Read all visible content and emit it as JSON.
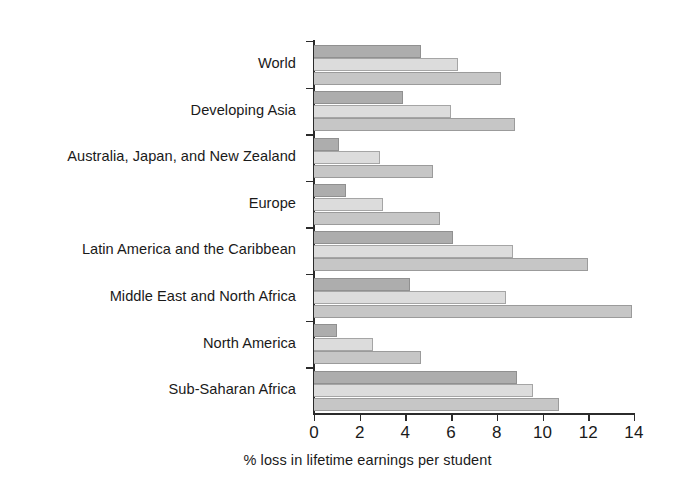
{
  "chart_data": {
    "type": "bar",
    "orientation": "horizontal",
    "title": "",
    "subtitle": "",
    "xlabel": "% loss in lifetime earnings per student",
    "ylabel": "",
    "xlim": [
      0,
      14
    ],
    "xticks": [
      0,
      2,
      4,
      6,
      8,
      10,
      12,
      14
    ],
    "xtick_labels": [
      "0",
      "2",
      "4",
      "6",
      "8",
      "10",
      "12",
      "14"
    ],
    "grid": false,
    "legend": "none",
    "categories": [
      "World",
      "Developing Asia",
      "Australia, Japan, and New Zealand",
      "Europe",
      "Latin America and the Caribbean",
      "Middle East and North Africa",
      "North America",
      "Sub-Saharan Africa"
    ],
    "series": [
      {
        "name": "series-1",
        "color": "#adadad",
        "values": [
          4.7,
          3.9,
          1.1,
          1.4,
          6.1,
          4.2,
          1.0,
          8.9
        ]
      },
      {
        "name": "series-2",
        "color": "#dcdcdc",
        "values": [
          6.3,
          6.0,
          2.9,
          3.0,
          8.7,
          8.4,
          2.6,
          9.6
        ]
      },
      {
        "name": "series-3",
        "color": "#c6c6c6",
        "values": [
          8.2,
          8.8,
          5.2,
          5.5,
          12.0,
          13.9,
          4.7,
          10.7
        ]
      }
    ]
  },
  "axis": {
    "x_title": "% loss in lifetime earnings per student",
    "tick_0": "0",
    "tick_1": "2",
    "tick_2": "4",
    "tick_3": "6",
    "tick_4": "8",
    "tick_5": "10",
    "tick_6": "12",
    "tick_7": "14"
  },
  "labels": {
    "cat_0": "World",
    "cat_1": "Developing Asia",
    "cat_2": "Australia, Japan, and New Zealand",
    "cat_3": "Europe",
    "cat_4": "Latin America and the Caribbean",
    "cat_5": "Middle East and North Africa",
    "cat_6": "North America",
    "cat_7": "Sub-Saharan Africa"
  },
  "colors": {
    "series_1": "#adadad",
    "series_2": "#dcdcdc",
    "series_3": "#c6c6c6",
    "axis": "#2b2b2b",
    "text": "#1a1a1a",
    "background": "#ffffff"
  }
}
